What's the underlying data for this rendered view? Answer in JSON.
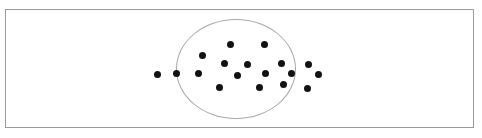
{
  "figure": {
    "title": "",
    "caption": "",
    "width": 482,
    "height": 138,
    "background_color": "#ffffff",
    "frame": {
      "label": "figure-border",
      "x": 5,
      "y": 9,
      "width": 469,
      "height": 119,
      "stroke_color": "#9a9a9a",
      "stroke_width": 1,
      "fill": "#ffffff"
    }
  },
  "chart_data": {
    "type": "scatter",
    "title": "",
    "subtitle": "",
    "xlabel": "",
    "ylabel": "",
    "xlim": [
      0,
      482
    ],
    "ylim": [
      0,
      138
    ],
    "grid": false,
    "legend": null,
    "annotations": [
      {
        "name": "cluster-boundary",
        "shape": "ellipse",
        "cx": 236,
        "cy": 69,
        "rx": 60,
        "ry": 50,
        "stroke_color": "#a8a8a8",
        "stroke_width": 1.4,
        "fill": "none"
      }
    ],
    "point_style": {
      "marker": "circle",
      "diameter": 7,
      "color": "#121212"
    },
    "series": [
      {
        "name": "points",
        "color": "#121212",
        "points": [
          {
            "x": 157,
            "y": 74,
            "inside_cluster": false
          },
          {
            "x": 176,
            "y": 73,
            "inside_cluster": false
          },
          {
            "x": 198,
            "y": 73,
            "inside_cluster": true
          },
          {
            "x": 202,
            "y": 55,
            "inside_cluster": true
          },
          {
            "x": 219,
            "y": 87,
            "inside_cluster": true
          },
          {
            "x": 224,
            "y": 63,
            "inside_cluster": true
          },
          {
            "x": 230,
            "y": 44,
            "inside_cluster": true
          },
          {
            "x": 237,
            "y": 75,
            "inside_cluster": true
          },
          {
            "x": 247,
            "y": 64,
            "inside_cluster": true
          },
          {
            "x": 259,
            "y": 87,
            "inside_cluster": true
          },
          {
            "x": 264,
            "y": 44,
            "inside_cluster": true
          },
          {
            "x": 265,
            "y": 73,
            "inside_cluster": true
          },
          {
            "x": 281,
            "y": 63,
            "inside_cluster": true
          },
          {
            "x": 283,
            "y": 84,
            "inside_cluster": true
          },
          {
            "x": 291,
            "y": 73,
            "inside_cluster": true
          },
          {
            "x": 308,
            "y": 64,
            "inside_cluster": false
          },
          {
            "x": 318,
            "y": 74,
            "inside_cluster": false
          },
          {
            "x": 307,
            "y": 88,
            "inside_cluster": false
          }
        ]
      }
    ]
  }
}
